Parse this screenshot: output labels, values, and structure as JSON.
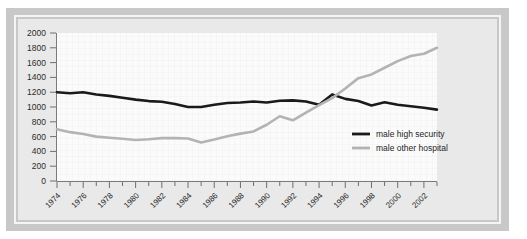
{
  "figure": {
    "frame_color": "#c8c8c8",
    "keyline_color": "#f4f4f4",
    "plot_background": "#fbfbfb",
    "grid_color": "#eeeeee"
  },
  "chart_data": {
    "type": "line",
    "title": "",
    "subtitle": "",
    "xlabel": "",
    "ylabel": "",
    "xlim": [
      1974,
      2003
    ],
    "ylim": [
      0,
      2000
    ],
    "grid": true,
    "legend_position": "center-right",
    "x": [
      1974,
      1975,
      1976,
      1977,
      1978,
      1979,
      1980,
      1981,
      1982,
      1983,
      1984,
      1985,
      1986,
      1987,
      1988,
      1989,
      1990,
      1991,
      1992,
      1993,
      1994,
      1995,
      1996,
      1997,
      1998,
      1999,
      2000,
      2001,
      2002,
      2003
    ],
    "xtick_labels": [
      "1974",
      "1976",
      "1978",
      "1980",
      "1982",
      "1984",
      "1986",
      "1988",
      "1990",
      "1992",
      "1994",
      "1996",
      "1998",
      "2000",
      "2002"
    ],
    "xtick_values": [
      1974,
      1976,
      1978,
      1980,
      1982,
      1984,
      1986,
      1988,
      1990,
      1992,
      1994,
      1996,
      1998,
      2000,
      2002
    ],
    "ytick_labels": [
      "0",
      "200",
      "400",
      "600",
      "800",
      "1000",
      "1200",
      "1400",
      "1600",
      "1800",
      "2000"
    ],
    "ytick_values": [
      0,
      200,
      400,
      600,
      800,
      1000,
      1200,
      1400,
      1600,
      1800,
      2000
    ],
    "series": [
      {
        "name": "male high security",
        "color": "#1a1a1a",
        "width": 2.6,
        "values": [
          1200,
          1185,
          1200,
          1170,
          1150,
          1125,
          1100,
          1080,
          1070,
          1040,
          1000,
          1000,
          1030,
          1055,
          1060,
          1075,
          1060,
          1085,
          1090,
          1075,
          1030,
          1170,
          1110,
          1080,
          1020,
          1065,
          1030,
          1010,
          990,
          965
        ]
      },
      {
        "name": "male other hospital",
        "color": "#b3b3b3",
        "width": 2.6,
        "values": [
          700,
          660,
          635,
          600,
          585,
          570,
          555,
          565,
          580,
          580,
          575,
          520,
          560,
          605,
          640,
          670,
          760,
          875,
          820,
          925,
          1025,
          1120,
          1250,
          1390,
          1440,
          1530,
          1620,
          1690,
          1720,
          1800
        ]
      }
    ]
  },
  "legend": {
    "items": [
      {
        "label": "male high security",
        "color": "#1a1a1a"
      },
      {
        "label": "male other hospital",
        "color": "#b3b3b3"
      }
    ]
  }
}
